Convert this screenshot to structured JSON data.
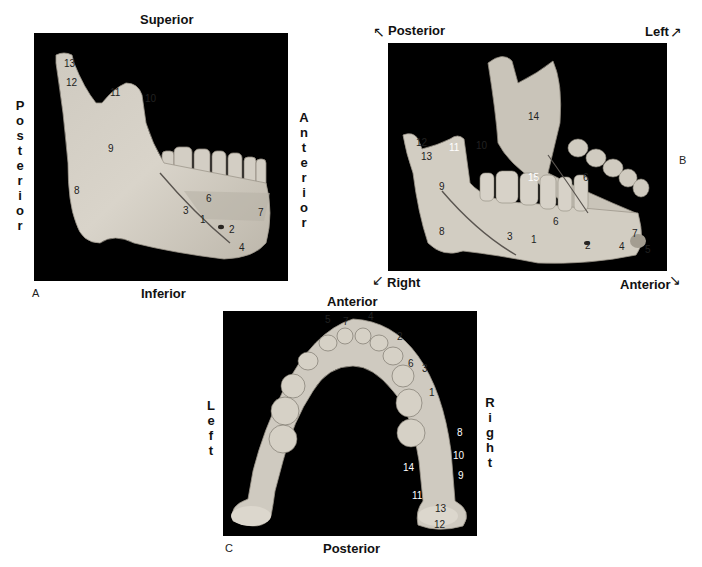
{
  "figure": {
    "panels": [
      {
        "id": "A",
        "letter": "A",
        "view": "Lateral view, right hemimandible",
        "orientation": {
          "top": "Superior",
          "bottom": "Inferior",
          "left": "Posterior",
          "right": "Anterior"
        },
        "labels": [
          "1",
          "2",
          "3",
          "4",
          "6",
          "7",
          "8",
          "9",
          "10",
          "11",
          "12",
          "13"
        ]
      },
      {
        "id": "B",
        "letter": "B",
        "view": "Anterolateral oblique view of mandible",
        "orientation": {
          "top_left": "Posterior",
          "top_right": "Left",
          "bottom_left": "Right",
          "bottom_right": "Anterior"
        },
        "labels": [
          "1",
          "2",
          "3",
          "4",
          "5",
          "6",
          "6",
          "7",
          "8",
          "9",
          "10",
          "11",
          "12",
          "13",
          "14",
          "15"
        ]
      },
      {
        "id": "C",
        "letter": "C",
        "view": "Superior view of mandible",
        "orientation": {
          "top": "Anterior",
          "bottom": "Posterior",
          "left": "Left",
          "right": "Right"
        },
        "labels": [
          "1",
          "2",
          "3",
          "4",
          "5",
          "6",
          "7",
          "8",
          "9",
          "10",
          "11",
          "12",
          "13",
          "14"
        ]
      }
    ],
    "vertical_text": {
      "A_left": "P\no\ns\nt\ne\nr\ni\no\nr",
      "A_right": "A\nn\nt\ne\nr\ni\no\nr",
      "C_left": "L\ne\nf\nt",
      "C_right": "R\ni\ng\nh\nt"
    },
    "arrows": {
      "nw": "↖",
      "ne": "↗",
      "sw": "↙",
      "se": "↘"
    },
    "colors": {
      "background": "#000000",
      "bone": "#d8d3c8",
      "bone_shadow": "#a9a398",
      "line": "#5a5550"
    }
  }
}
